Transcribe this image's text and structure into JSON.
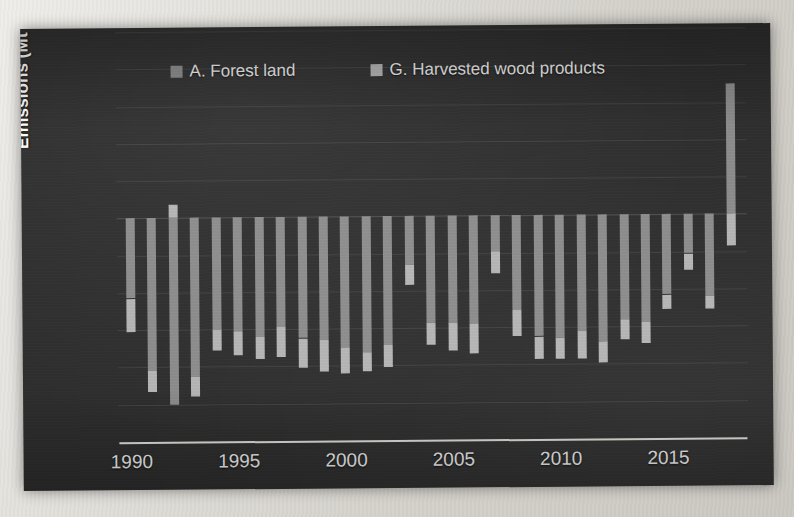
{
  "chart": {
    "ylabel_prefix": "Emissions (Mt CO",
    "ylabel_sub": "2",
    "ylabel_suffix": " eq.)",
    "ylabel_full": "Emissions (Mt CO2 eq.)",
    "legend": [
      {
        "name": "legend-forest-land",
        "label": "A.  Forest land",
        "color": "#8c8c8c"
      },
      {
        "name": "legend-harvested-wood",
        "label": "G.  Harvested wood products",
        "color": "#b5b5b5"
      }
    ],
    "y_ticks": [
      "10",
      "8",
      "6",
      "4",
      "2",
      "0",
      "-2",
      "-4",
      "-6",
      "-8",
      "-10",
      "-12"
    ],
    "x_ticks": [
      "1990",
      "1995",
      "2000",
      "2005",
      "2010",
      "2015"
    ]
  },
  "chart_data": {
    "type": "bar",
    "subtype": "stacked-bar",
    "title": "",
    "xlabel": "",
    "ylabel": "Emissions (Mt CO2 eq.)",
    "ylim": [
      -12,
      10
    ],
    "ytick_step": 2,
    "grid": true,
    "legend_position": "top-inside",
    "categories": [
      1990,
      1991,
      1992,
      1993,
      1994,
      1995,
      1996,
      1997,
      1998,
      1999,
      2000,
      2001,
      2002,
      2003,
      2004,
      2005,
      2006,
      2007,
      2008,
      2009,
      2010,
      2011,
      2012,
      2013,
      2014,
      2015,
      2016,
      2017,
      2018
    ],
    "xtick_categories": [
      1990,
      1995,
      2000,
      2005,
      2010,
      2015
    ],
    "series": [
      {
        "name": "A.  Forest land",
        "color": "#8c8c8c",
        "values": [
          -4.3,
          -8.2,
          -10.0,
          -8.5,
          -6.0,
          -6.1,
          -6.4,
          -5.9,
          -6.5,
          -6.6,
          -7.0,
          -7.3,
          -6.9,
          -2.6,
          -5.7,
          -5.7,
          -5.8,
          -1.9,
          -5.1,
          -6.5,
          -6.6,
          -6.2,
          -6.8,
          -5.6,
          -5.8,
          -4.3,
          -2.1,
          -4.4,
          7.0
        ]
      },
      {
        "name": "G.  Harvested wood products",
        "color": "#b5b5b5",
        "values": [
          -1.8,
          -1.1,
          0.7,
          -1.1,
          -1.1,
          -1.3,
          -1.2,
          -1.6,
          -1.6,
          -1.7,
          -1.4,
          -1.0,
          -1.2,
          -1.1,
          -1.2,
          -1.5,
          -1.6,
          -1.2,
          -1.4,
          -1.2,
          -1.1,
          -1.5,
          -1.1,
          -1.1,
          -1.1,
          -0.8,
          -0.9,
          -0.7,
          -1.7
        ]
      }
    ],
    "totals": [
      -6.1,
      -9.3,
      -10.8,
      -9.6,
      -7.1,
      -7.4,
      -7.6,
      -7.5,
      -8.1,
      -8.3,
      -8.4,
      -8.3,
      -8.1,
      -3.7,
      -6.9,
      -7.2,
      -7.4,
      -3.1,
      -6.5,
      -7.7,
      -7.7,
      -7.7,
      -7.9,
      -6.7,
      -6.9,
      -5.1,
      -3.0,
      -5.1,
      7.0
    ]
  }
}
